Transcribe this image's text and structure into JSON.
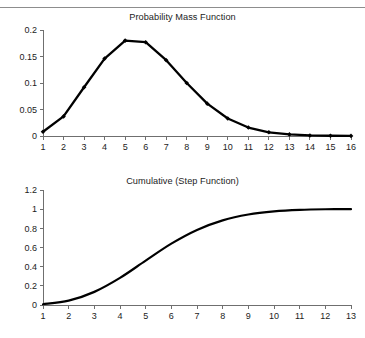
{
  "page": {
    "background_color": "#ffffff",
    "line_color": "#000000",
    "axis_color": "#6f6f6f",
    "text_color": "#1c1c1c",
    "rule_color": "#8d8d8d"
  },
  "charts": {
    "pmf": {
      "title": "Probability Mass Function",
      "y_ticks": [
        "0",
        "0.05",
        "0.1",
        "0.15",
        "0.2"
      ],
      "x_ticks": [
        "1",
        "2",
        "3",
        "4",
        "5",
        "6",
        "7",
        "8",
        "9",
        "10",
        "11",
        "12",
        "13",
        "14",
        "15",
        "16"
      ]
    },
    "cdf": {
      "title": "Cumulative (Step Function)",
      "y_ticks": [
        "0",
        "0.2",
        "0.4",
        "0.6",
        "0.8",
        "1",
        "1.2"
      ],
      "x_ticks": [
        "1",
        "2",
        "3",
        "4",
        "5",
        "6",
        "7",
        "8",
        "9",
        "10",
        "11",
        "12",
        "13"
      ]
    }
  },
  "chart_data": [
    {
      "type": "line",
      "id": "probability-mass-function",
      "title": "Probability Mass Function",
      "xlabel": "",
      "ylabel": "",
      "x": [
        1,
        2,
        3,
        4,
        5,
        6,
        7,
        8,
        9,
        10,
        11,
        12,
        13,
        14,
        15,
        16
      ],
      "values": [
        0.008,
        0.037,
        0.092,
        0.146,
        0.18,
        0.177,
        0.143,
        0.1,
        0.061,
        0.033,
        0.016,
        0.007,
        0.003,
        0.001,
        0.0005,
        0.0002
      ],
      "xlim": [
        1,
        16
      ],
      "ylim": [
        0,
        0.2
      ],
      "ytick_values": [
        0,
        0.05,
        0.1,
        0.15,
        0.2
      ],
      "xtick_values": [
        1,
        2,
        3,
        4,
        5,
        6,
        7,
        8,
        9,
        10,
        11,
        12,
        13,
        14,
        15,
        16
      ],
      "markers": "diamond",
      "grid": false,
      "legend": false
    },
    {
      "type": "line",
      "id": "cumulative-step-function",
      "title": "Cumulative (Step Function)",
      "xlabel": "",
      "ylabel": "",
      "x": [
        1,
        2,
        3,
        4,
        5,
        6,
        7,
        8,
        9,
        10,
        11,
        12,
        13
      ],
      "values": [
        0.008,
        0.045,
        0.137,
        0.283,
        0.463,
        0.64,
        0.783,
        0.883,
        0.944,
        0.977,
        0.993,
        0.999,
        1.0
      ],
      "xlim": [
        1,
        13
      ],
      "ylim": [
        0,
        1.2
      ],
      "ytick_values": [
        0,
        0.2,
        0.4,
        0.6,
        0.8,
        1.0,
        1.2
      ],
      "xtick_values": [
        1,
        2,
        3,
        4,
        5,
        6,
        7,
        8,
        9,
        10,
        11,
        12,
        13
      ],
      "markers": "none",
      "grid": false,
      "legend": false
    }
  ]
}
